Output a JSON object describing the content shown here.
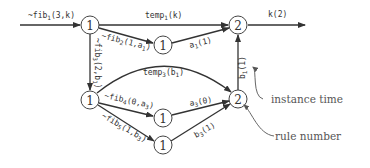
{
  "diagram": {
    "nodes": [
      {
        "id": "A",
        "label": "1",
        "x": 90,
        "y": 25
      },
      {
        "id": "B",
        "label": "1",
        "x": 163,
        "y": 45
      },
      {
        "id": "C",
        "label": "2",
        "x": 238,
        "y": 25
      },
      {
        "id": "D",
        "label": "1",
        "x": 90,
        "y": 100
      },
      {
        "id": "E",
        "label": "1",
        "x": 163,
        "y": 118
      },
      {
        "id": "F",
        "label": "1",
        "x": 163,
        "y": 145
      },
      {
        "id": "G",
        "label": "2",
        "x": 238,
        "y": 99
      }
    ],
    "edges": [
      {
        "from": "input",
        "to": "A",
        "label": "~fib1(3,k)"
      },
      {
        "from": "A",
        "to": "C",
        "label": "temp1(k)"
      },
      {
        "from": "A",
        "to": "B",
        "label": "~fib2(1,a1)"
      },
      {
        "from": "B",
        "to": "C",
        "label": "a1(1)"
      },
      {
        "from": "A",
        "to": "D",
        "label": "~fib3(2,b1)"
      },
      {
        "from": "C",
        "to": "output",
        "label": "k(2)"
      },
      {
        "from": "D",
        "to": "G",
        "label": "temp3(b1)"
      },
      {
        "from": "D",
        "to": "E",
        "label": "~fib4(0,a3)"
      },
      {
        "from": "D",
        "to": "F",
        "label": "~fib5(1,b3)"
      },
      {
        "from": "E",
        "to": "G",
        "label": "a3(0)"
      },
      {
        "from": "F",
        "to": "G",
        "label": "b3(1)"
      },
      {
        "from": "G",
        "to": "C",
        "label": "b1(1)"
      }
    ],
    "annotations": {
      "instance_time": "instance time",
      "rule_number": "rule number"
    }
  },
  "labels": {
    "in_fib1_name": "~fib",
    "in_fib1_sub": "1",
    "in_fib1_args": "(3,k)",
    "temp1_name": "temp",
    "temp1_sub": "1",
    "temp1_args": "(k)",
    "fib2_name": "~fib",
    "fib2_sub": "2",
    "fib2_args": "(1,a",
    "fib2_sub2": "1",
    "fib2_close": ")",
    "a1_name": "a",
    "a1_sub": "1",
    "a1_args": "(1)",
    "fib3_name": "~fib",
    "fib3_sub": "3",
    "fib3_args": "(2,b",
    "fib3_sub2": "1",
    "fib3_close": ")",
    "k2": "k(2)",
    "temp3_name": "temp",
    "temp3_sub": "3",
    "temp3_args": "(b",
    "temp3_sub2": "1",
    "temp3_close": ")",
    "fib4_name": "~fib",
    "fib4_sub": "4",
    "fib4_args": "(0,a",
    "fib4_sub2": "3",
    "fib4_close": ")",
    "fib5_name": "~fib",
    "fib5_sub": "5",
    "fib5_args": "(1,b",
    "fib5_sub2": "3",
    "fib5_close": ")",
    "a3_name": "a",
    "a3_sub": "3",
    "a3_args": "(0)",
    "b3_name": "b",
    "b3_sub": "3",
    "b3_args": "(1)",
    "b1_name": "b",
    "b1_sub": "1",
    "b1_args": "(1)"
  }
}
